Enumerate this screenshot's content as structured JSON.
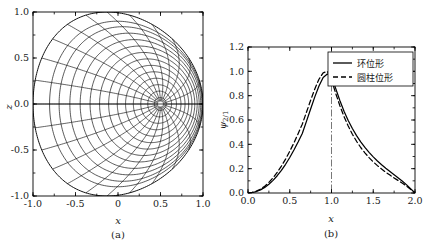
{
  "figure": {
    "panels": [
      {
        "id": "a",
        "caption": "(a)",
        "xlabel": "x",
        "ylabel": "z",
        "xticks": [
          "-1.0",
          "-0.5",
          "0",
          "0.5",
          "1.0"
        ],
        "xtick_values": [
          -1.0,
          -0.5,
          0,
          0.5,
          1.0
        ],
        "yticks": [
          "-1.0",
          "-0.5",
          "0.0",
          "0.5",
          "1.0"
        ],
        "ytick_values": [
          -1.0,
          -0.5,
          0.0,
          0.5,
          1.0
        ],
        "xlim": [
          -1.0,
          1.0
        ],
        "ylim": [
          -1.0,
          1.0
        ]
      },
      {
        "id": "b",
        "caption": "(b)",
        "xlabel": "x",
        "ylabel": "ψ",
        "ylabel_sub": "2/1",
        "xticks": [
          "0.0",
          "0.5",
          "1.0",
          "1.5",
          "2.0"
        ],
        "xtick_values": [
          0.0,
          0.5,
          1.0,
          1.5,
          2.0
        ],
        "yticks": [
          "0.0",
          "0.2",
          "0.4",
          "0.6",
          "0.8",
          "1.0",
          "1.2"
        ],
        "ytick_values": [
          0.0,
          0.2,
          0.4,
          0.6,
          0.8,
          1.0,
          1.2
        ],
        "xlim": [
          0.0,
          2.0
        ],
        "ylim": [
          0.0,
          1.2
        ],
        "legend": [
          {
            "label": "环位形",
            "style": "solid"
          },
          {
            "label": "圆柱位形",
            "style": "dashed"
          }
        ],
        "marker_line_x": 1.0
      }
    ]
  },
  "colors": {
    "ink": "#1a1a1a",
    "curve": "#000000",
    "marker_line": "#555555",
    "frame": "#000000"
  },
  "chart_data": [
    {
      "type": "line",
      "panel": "a",
      "title": "",
      "xlabel": "x",
      "ylabel": "z",
      "xlim": [
        -1.0,
        1.0
      ],
      "ylim": [
        -1.0,
        1.0
      ],
      "grid": false,
      "description": "Nested toroidal flux-surface contours inside the unit circle with an orthogonal family of radial grid curves; surfaces crowd toward the magnetic axis near x = 0.5, z = 0.",
      "magnetic_axis": [
        0.5,
        0.0
      ],
      "boundary_radius": 1.0,
      "n_flux_surfaces": 14,
      "n_radial_lines": 24,
      "flux_surface_levels": [
        0.07,
        0.14,
        0.21,
        0.28,
        0.35,
        0.42,
        0.49,
        0.56,
        0.63,
        0.7,
        0.77,
        0.84,
        0.9,
        1.0
      ]
    },
    {
      "type": "line",
      "panel": "b",
      "title": "",
      "xlabel": "x",
      "ylabel": "ψ 2/1",
      "xlim": [
        0.0,
        2.0
      ],
      "ylim": [
        0.0,
        1.2
      ],
      "grid": false,
      "legend_position": "top-right",
      "x": [
        0.0,
        0.05,
        0.1,
        0.15,
        0.2,
        0.25,
        0.3,
        0.35,
        0.4,
        0.45,
        0.5,
        0.55,
        0.6,
        0.65,
        0.7,
        0.75,
        0.8,
        0.85,
        0.9,
        0.95,
        1.0,
        1.05,
        1.1,
        1.15,
        1.2,
        1.25,
        1.3,
        1.35,
        1.4,
        1.45,
        1.5,
        1.55,
        1.6,
        1.65,
        1.7,
        1.75,
        1.8,
        1.85,
        1.9,
        1.95,
        2.0
      ],
      "series": [
        {
          "name": "环位形",
          "style": "solid",
          "values": [
            0.0,
            0.004,
            0.012,
            0.026,
            0.046,
            0.072,
            0.104,
            0.142,
            0.186,
            0.236,
            0.292,
            0.353,
            0.419,
            0.489,
            0.589,
            0.69,
            0.79,
            0.88,
            0.95,
            0.978,
            0.96,
            0.86,
            0.76,
            0.672,
            0.596,
            0.53,
            0.472,
            0.421,
            0.375,
            0.334,
            0.297,
            0.263,
            0.232,
            0.203,
            0.176,
            0.15,
            0.124,
            0.097,
            0.067,
            0.034,
            0.0
          ]
        },
        {
          "name": "圆柱位形",
          "style": "dashed",
          "values": [
            0.0,
            0.005,
            0.015,
            0.032,
            0.056,
            0.087,
            0.125,
            0.17,
            0.221,
            0.279,
            0.343,
            0.412,
            0.487,
            0.566,
            0.664,
            0.762,
            0.855,
            0.935,
            0.988,
            1.0,
            0.93,
            0.82,
            0.718,
            0.628,
            0.55,
            0.483,
            0.425,
            0.374,
            0.33,
            0.291,
            0.256,
            0.225,
            0.197,
            0.171,
            0.147,
            0.124,
            0.102,
            0.08,
            0.056,
            0.029,
            0.0
          ]
        }
      ]
    }
  ]
}
